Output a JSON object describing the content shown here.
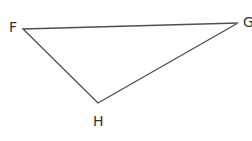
{
  "diagram": {
    "type": "triangle",
    "stroke_color": "#505050",
    "stroke_width": 1.4,
    "vertices": [
      {
        "name": "F",
        "x": 23,
        "y": 29,
        "label_x": 9,
        "label_y": 32
      },
      {
        "name": "G",
        "x": 238,
        "y": 23,
        "label_x": 243,
        "label_y": 27
      },
      {
        "name": "H",
        "x": 98,
        "y": 103,
        "label_x": 93,
        "label_y": 126
      }
    ],
    "labels": {
      "F": "F",
      "G": "G",
      "H": "H"
    }
  }
}
